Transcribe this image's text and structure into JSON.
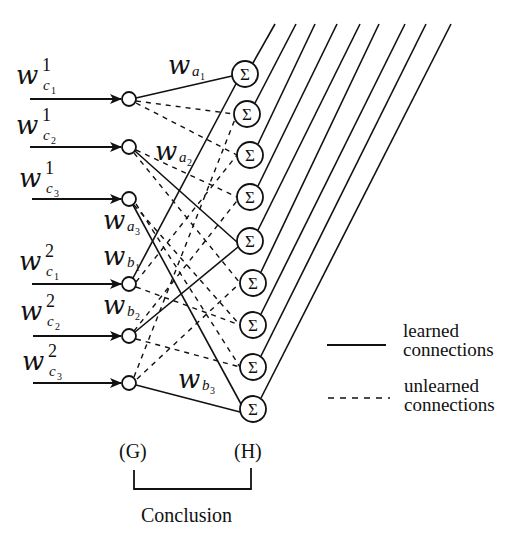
{
  "diagram": {
    "inputs": [
      {
        "weight": "w",
        "sup": "1",
        "sub": "c",
        "subsub": "1"
      },
      {
        "weight": "w",
        "sup": "1",
        "sub": "c",
        "subsub": "2"
      },
      {
        "weight": "w",
        "sup": "1",
        "sub": "c",
        "subsub": "3"
      },
      {
        "weight": "w",
        "sup": "2",
        "sub": "c",
        "subsub": "1"
      },
      {
        "weight": "w",
        "sup": "2",
        "sub": "c",
        "subsub": "2"
      },
      {
        "weight": "w",
        "sup": "2",
        "sub": "c",
        "subsub": "3"
      }
    ],
    "learned_weights": [
      {
        "weight": "w",
        "sub": "a",
        "subsub": "1"
      },
      {
        "weight": "w",
        "sub": "a",
        "subsub": "2"
      },
      {
        "weight": "w",
        "sub": "a",
        "subsub": "3"
      },
      {
        "weight": "w",
        "sub": "b",
        "subsub": "1"
      },
      {
        "weight": "w",
        "sub": "b",
        "subsub": "2"
      },
      {
        "weight": "w",
        "sub": "b",
        "subsub": "3"
      }
    ],
    "sum_symbol": "Σ",
    "sum_node_count": 9,
    "layer_labels": {
      "g": "(G)",
      "h": "(H)"
    },
    "bracket_label": "Conclusion"
  },
  "legend": {
    "learned": {
      "line1": "learned",
      "line2": "connections",
      "style": "solid"
    },
    "unlearned": {
      "line1": "unlearned",
      "line2": "connections",
      "style": "dashed"
    }
  },
  "colors": {
    "stroke": "#111111",
    "background": "#ffffff"
  }
}
